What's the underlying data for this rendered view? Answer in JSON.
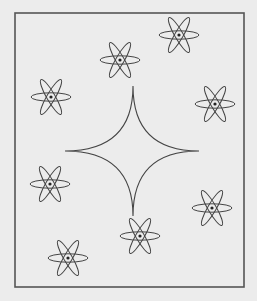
{
  "figure": {
    "background": "#ececec",
    "stroke": "#444444",
    "frame": {
      "x": 15,
      "y": 13,
      "w": 229,
      "h": 274
    },
    "star": {
      "cx": 133,
      "cy": 151,
      "top": 86,
      "bottom": 216,
      "left": 65,
      "right": 199
    },
    "flowers": [
      {
        "cx": 179,
        "cy": 35
      },
      {
        "cx": 120,
        "cy": 60
      },
      {
        "cx": 51,
        "cy": 97
      },
      {
        "cx": 215,
        "cy": 104
      },
      {
        "cx": 50,
        "cy": 184
      },
      {
        "cx": 212,
        "cy": 208
      },
      {
        "cx": 140,
        "cy": 236
      },
      {
        "cx": 68,
        "cy": 258
      }
    ],
    "petal": {
      "length": 20,
      "width": 4.2
    }
  }
}
